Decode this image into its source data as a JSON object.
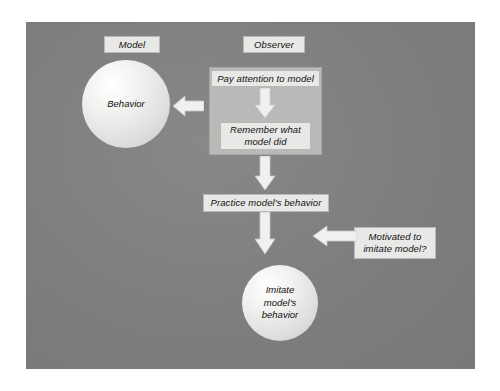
{
  "diagram": {
    "background_color": "#808080",
    "box_fill_color": "#e8e8e6",
    "panel_fill_color": "#b9b9b7",
    "arrow_color": "#f0f0ee",
    "tags": {
      "model": "Model",
      "observer": "Observer"
    },
    "nodes": {
      "behavior_circle": "Behavior",
      "pay_attention": "Pay attention to model",
      "remember_line1": "Remember what",
      "remember_line2": "model did",
      "practice": "Practice model's behavior",
      "motivated_line1": "Motivated to",
      "motivated_line2": "imitate model?",
      "imitate_line1": "Imitate",
      "imitate_line2": "model's",
      "imitate_line3": "behavior"
    },
    "arrows": {
      "to_behavior": "arrow-left-icon",
      "attention_to_remember": "arrow-down-icon",
      "remember_to_practice": "arrow-down-icon",
      "practice_to_imitate": "arrow-down-icon",
      "motivated_to_flow": "arrow-left-icon"
    }
  }
}
